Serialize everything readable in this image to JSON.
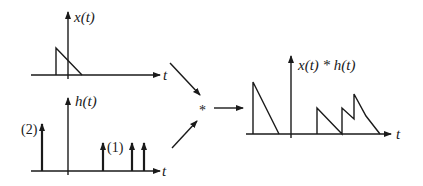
{
  "diagram": {
    "operator_symbol": "*",
    "x_plot": {
      "ylabel": "x(t)",
      "xlabel": "t",
      "shape": "right-triangle pulse starting left of origin, decreasing linearly to zero right of origin"
    },
    "h_plot": {
      "ylabel": "h(t)",
      "xlabel": "t",
      "impulses": [
        {
          "position": "left of origin",
          "weight_label": "(2)"
        },
        {
          "position": "right of origin, first",
          "weight_label": "(1)"
        },
        {
          "position": "right of origin, second",
          "weight_label": ""
        },
        {
          "position": "right of origin, third",
          "weight_label": ""
        }
      ]
    },
    "result_plot": {
      "ylabel": "x(t) * h(t)",
      "xlabel": "t",
      "shape": "tall triangle left of origin plus overlapping sawtooth triangles right of origin"
    }
  },
  "colors": {
    "ink": "#1a1a1a",
    "background": "#ffffff"
  }
}
